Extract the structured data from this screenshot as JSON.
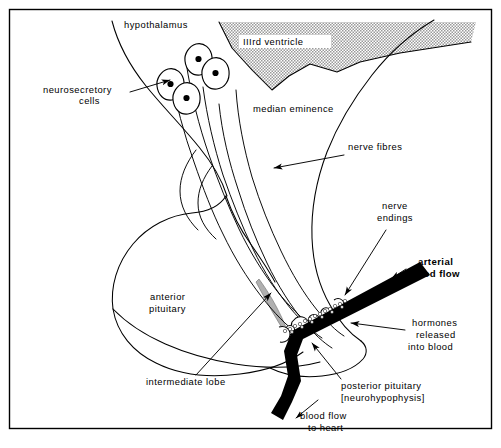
{
  "figure": {
    "background_color": "#ffffff",
    "ink_color": "#000000",
    "ventricle_fill": "#cccccc",
    "intermediate_lobe_fill": "#b3b3b3",
    "width": 501,
    "height": 448
  },
  "labels": {
    "hypothalamus": "hypothalamus",
    "neurosecretory_cells_line1": "neurosecretory",
    "neurosecretory_cells_line2": "cells",
    "third_ventricle": "IIIrd  ventricle",
    "median_eminence": "median  eminence",
    "nerve_fibres": "nerve  fibres",
    "nerve_endings_line1": "nerve",
    "nerve_endings_line2": "endings",
    "arterial_blood_flow_line1": "arterial",
    "arterial_blood_flow_line2": "blood  flow",
    "hormones_line1": "hormones",
    "hormones_line2": "released",
    "hormones_line3": "into  blood",
    "anterior_pituitary_line1": "anterior",
    "anterior_pituitary_line2": "pituitary",
    "intermediate_lobe": "intermediate  lobe",
    "posterior_pituitary_line1": "posterior  pituitary",
    "posterior_pituitary_line2": "[neurohypophysis]",
    "blood_flow_to_heart_line1": "blood  flow",
    "blood_flow_to_heart_line2": "to  heart"
  },
  "structures": [
    {
      "name": "hypothalamus",
      "description": "Brain region at top left, outlined by a curving line"
    },
    {
      "name": "third-ventricle",
      "description": "Stippled grey wedge at top of figure"
    },
    {
      "name": "median-eminence",
      "description": "Region below the third ventricle where fibres converge"
    },
    {
      "name": "neurosecretory-cells",
      "description": "Four teardrop cell bodies with dark nuclei"
    },
    {
      "name": "nerve-fibres",
      "description": "Bundle of axons running down the pituitary stalk"
    },
    {
      "name": "anterior-pituitary",
      "description": "Large rounded lobe on the left"
    },
    {
      "name": "intermediate-lobe",
      "description": "Narrow grey sliver between anterior and posterior lobes"
    },
    {
      "name": "posterior-pituitary",
      "description": "Lobe at lower right containing nerve endings"
    },
    {
      "name": "nerve-endings",
      "description": "Bulbous axon terminals abutting the capillary"
    },
    {
      "name": "blood-vessel",
      "description": "Thick black vessel carrying arterial blood in and venous blood to heart"
    },
    {
      "name": "hormone-granules",
      "description": "Small pale dots released from endings into the vessel"
    }
  ],
  "icon_names": {
    "arrow": "arrow-icon",
    "leader_line": "leader-line-icon"
  }
}
